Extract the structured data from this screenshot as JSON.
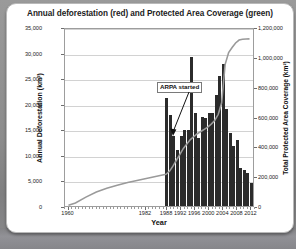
{
  "card": {
    "title": "Annual deforestation (red) and Protected Area Coverage (green)"
  },
  "annotation": {
    "label": "ARPA started",
    "points_to_year": 2002
  },
  "colors": {
    "bar": "#2b2b2b",
    "line": "#9a9a9a",
    "grid": "#d2d2d2",
    "axis": "#9d9d9d",
    "card_background": "#ffffff",
    "page_background": "#8e8e8e"
  },
  "chart_data": {
    "type": "bar",
    "title": "Annual deforestation (red) and Protected Area Coverage (green)",
    "xlabel": "Year",
    "ylabel": "Annual Deforestation (km²)",
    "y2label": "Total Protected Area Coverage (km²)",
    "xlim": [
      1959,
      2013
    ],
    "ylim": [
      0,
      35000
    ],
    "y2lim": [
      0,
      1200000
    ],
    "grid": true,
    "legend": "none",
    "yticks": [
      "0",
      "5,000",
      "10,000",
      "15,000",
      "20,000",
      "25,000",
      "30,000",
      "35,000"
    ],
    "ytick_values": [
      0,
      5000,
      10000,
      15000,
      20000,
      25000,
      30000,
      35000
    ],
    "y2ticks": [
      "0",
      "200,000",
      "400,000",
      "600,000",
      "800,000",
      "1,000,000",
      "1,200,000"
    ],
    "y2tick_values": [
      0,
      200000,
      400000,
      600000,
      800000,
      1000000,
      1200000
    ],
    "xticks": [
      "1960",
      "1982",
      "1988",
      "1992",
      "1996",
      "2000",
      "2004",
      "2008",
      "2012"
    ],
    "xtick_values": [
      1960,
      1982,
      1988,
      1992,
      1996,
      2000,
      2004,
      2008,
      2012
    ],
    "series": [
      {
        "name": "Annual Deforestation (km²)",
        "type": "bar",
        "axis": "left",
        "color": "#2b2b2b",
        "x": [
          1988,
          1989,
          1990,
          1991,
          1992,
          1993,
          1994,
          1995,
          1996,
          1997,
          1998,
          1999,
          2000,
          2001,
          2002,
          2003,
          2004,
          2005,
          2006,
          2007,
          2008,
          2009,
          2010,
          2011,
          2012
        ],
        "values": [
          21050,
          17770,
          13730,
          11030,
          13786,
          14896,
          14896,
          29059,
          18161,
          13227,
          17383,
          17259,
          18226,
          18165,
          21651,
          25396,
          27772,
          19014,
          14286,
          11651,
          12911,
          7464,
          7000,
          6418,
          4571
        ]
      },
      {
        "name": "Total Protected Area Coverage (km²)",
        "type": "line",
        "axis": "right",
        "color": "#9a9a9a",
        "x": [
          1960,
          1962,
          1965,
          1968,
          1971,
          1974,
          1977,
          1980,
          1983,
          1986,
          1988,
          1989,
          1990,
          1991,
          1992,
          1993,
          1994,
          1995,
          1996,
          1997,
          1998,
          1999,
          2000,
          2001,
          2002,
          2003,
          2004,
          2005,
          2006,
          2007,
          2008,
          2009,
          2010,
          2011,
          2012
        ],
        "values": [
          5000,
          20000,
          60000,
          95000,
          120000,
          140000,
          160000,
          175000,
          190000,
          205000,
          215000,
          235000,
          270000,
          310000,
          350000,
          390000,
          420000,
          450000,
          470000,
          490000,
          505000,
          520000,
          535000,
          555000,
          580000,
          620000,
          700000,
          960000,
          1040000,
          1075000,
          1105000,
          1125000,
          1130000,
          1132000,
          1133000
        ]
      }
    ]
  }
}
